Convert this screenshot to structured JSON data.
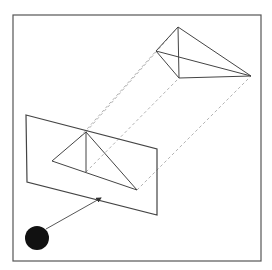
{
  "diagram": {
    "title": "",
    "colors": {
      "background": "#ffffff",
      "frame": "#555555",
      "solid_line": "#444444",
      "dashed_line": "#aaaaaa",
      "viewer": "#111111"
    },
    "frame": {
      "x": 13,
      "y": 15,
      "width": 248,
      "height": 246
    },
    "projection_plane": {
      "points": [
        [
          26,
          115
        ],
        [
          157,
          149
        ],
        [
          157,
          215
        ],
        [
          27,
          182
        ]
      ]
    },
    "front_triangle": {
      "apex": [
        86,
        132
      ],
      "left": [
        52,
        161
      ],
      "bottom": [
        86,
        172
      ],
      "right": [
        137,
        190
      ]
    },
    "back_pyramid": {
      "apex": [
        178,
        27
      ],
      "left": [
        156,
        51
      ],
      "bottom": [
        179,
        78
      ],
      "right": [
        251,
        76
      ]
    },
    "projection_lines": [
      {
        "from": [
          86,
          132
        ],
        "to": [
          178,
          27
        ]
      },
      {
        "from": [
          80,
          137
        ],
        "to": [
          156,
          51
        ]
      },
      {
        "from": [
          86,
          172
        ],
        "to": [
          179,
          78
        ]
      },
      {
        "from": [
          137,
          190
        ],
        "to": [
          251,
          76
        ]
      }
    ],
    "viewer": {
      "cx": 37,
      "cy": 238,
      "r": 12
    },
    "view_arrow": {
      "from": [
        46,
        229
      ],
      "to": [
        101,
        198
      ]
    }
  }
}
